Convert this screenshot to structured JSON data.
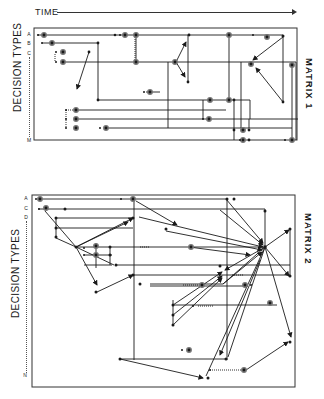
{
  "header": {
    "time_label": "TIME"
  },
  "matrix1": {
    "title": "MATRIX 1",
    "y_title": "DECISION TYPES",
    "row_labels": [
      "A",
      "B",
      "C",
      "M"
    ]
  },
  "matrix2": {
    "title": "MATRIX 2",
    "y_title": "DECISION TYPES",
    "row_labels": [
      "A",
      "C",
      "D",
      "N"
    ]
  },
  "legend": {
    "node_small": "small dot = decision event",
    "node_circled": "circled dot = key decision",
    "edge_solid": "solid line = decision flow",
    "edge_dotted": "dotted line = linked decision"
  },
  "colors": {
    "ink": "#1a1a1a",
    "frame": "#333333",
    "background": "#ffffff"
  }
}
